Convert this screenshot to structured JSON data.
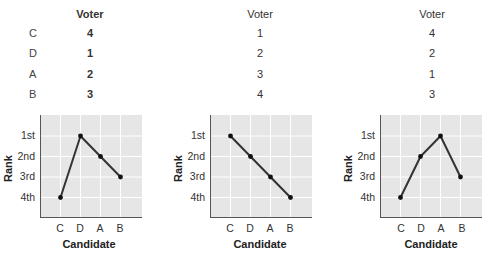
{
  "table": {
    "header": "Voter",
    "candidates": [
      "C",
      "D",
      "A",
      "B"
    ],
    "voters": [
      {
        "ranks": [
          "4",
          "1",
          "2",
          "3"
        ]
      },
      {
        "ranks": [
          "1",
          "2",
          "3",
          "4"
        ]
      },
      {
        "ranks": [
          "4",
          "2",
          "1",
          "3"
        ]
      }
    ]
  },
  "axis": {
    "xlabel": "Candidate",
    "ylabel": "Rank",
    "yticks": [
      "1st",
      "2nd",
      "3rd",
      "4th"
    ],
    "xticks": [
      "C",
      "D",
      "A",
      "B"
    ]
  },
  "colors": {
    "plot_bg": "#e6e6e6",
    "grid": "#ffffff",
    "line": "#333333",
    "axis": "#555555"
  },
  "chart_data": [
    {
      "type": "line",
      "title": "",
      "xlabel": "Candidate",
      "ylabel": "Rank",
      "categories": [
        "C",
        "D",
        "A",
        "B"
      ],
      "yticks": [
        "1st",
        "2nd",
        "3rd",
        "4th"
      ],
      "values": [
        4,
        1,
        2,
        3
      ],
      "ylim": [
        0,
        5
      ],
      "y_inverted": true,
      "grid": true
    },
    {
      "type": "line",
      "title": "",
      "xlabel": "Candidate",
      "ylabel": "Rank",
      "categories": [
        "C",
        "D",
        "A",
        "B"
      ],
      "yticks": [
        "1st",
        "2nd",
        "3rd",
        "4th"
      ],
      "values": [
        1,
        2,
        3,
        4
      ],
      "ylim": [
        0,
        5
      ],
      "y_inverted": true,
      "grid": true
    },
    {
      "type": "line",
      "title": "",
      "xlabel": "Candidate",
      "ylabel": "Rank",
      "categories": [
        "C",
        "D",
        "A",
        "B"
      ],
      "yticks": [
        "1st",
        "2nd",
        "3rd",
        "4th"
      ],
      "values": [
        4,
        2,
        1,
        3
      ],
      "ylim": [
        0,
        5
      ],
      "y_inverted": true,
      "grid": true
    }
  ]
}
